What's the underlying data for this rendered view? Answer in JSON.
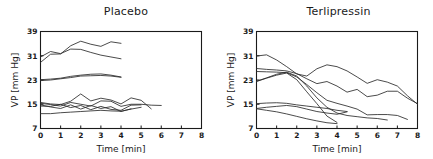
{
  "figure": {
    "background": "#ffffff",
    "line_color": "#2b2b2b",
    "axis_color": "#1a1a1a"
  },
  "panels": [
    {
      "id": "placebo",
      "title": "Placebo"
    },
    {
      "id": "terlipressin",
      "title": "Terlipressin"
    }
  ],
  "axes": {
    "xlabel": "Time [min]",
    "ylabel": "VP [mm Hg]",
    "xticks": [
      "0",
      "1",
      "2",
      "3",
      "4",
      "5",
      "6",
      "7",
      "8"
    ],
    "yticks": [
      "7",
      "15",
      "23",
      "31",
      "39"
    ],
    "xlim": [
      0,
      8
    ],
    "ylim": [
      7,
      39
    ]
  },
  "chart_data": [
    {
      "type": "line",
      "title": "Placebo",
      "xlabel": "Time [min]",
      "ylabel": "VP [mm Hg]",
      "xlim": [
        0,
        8
      ],
      "ylim": [
        7,
        39
      ],
      "grid": false,
      "legend": "none",
      "x_ticks": [
        0,
        1,
        2,
        3,
        4,
        5,
        6,
        7,
        8
      ],
      "y_ticks": [
        7,
        15,
        23,
        31,
        39
      ],
      "series": [
        {
          "name": "subject-p1",
          "x": [
            0,
            0.5,
            1,
            1.5,
            2,
            2.5,
            3,
            3.5,
            4
          ],
          "y": [
            28.8,
            31.5,
            31.6,
            34.3,
            35.8,
            34.8,
            34.1,
            35.6,
            35.1
          ]
        },
        {
          "name": "subject-p2",
          "x": [
            0,
            0.5,
            1,
            1.5,
            2,
            2.5,
            3,
            3.5,
            4
          ],
          "y": [
            30.6,
            32.4,
            31.7,
            33.2,
            33.1,
            32.1,
            31.2,
            30.6,
            30.0
          ]
        },
        {
          "name": "subject-p3",
          "x": [
            0,
            0.5,
            1,
            1.5,
            2,
            2.5,
            3,
            3.5,
            4
          ],
          "y": [
            23.1,
            23.3,
            23.6,
            24.2,
            24.6,
            24.9,
            25.0,
            24.6,
            24.0
          ]
        },
        {
          "name": "subject-p4",
          "x": [
            0,
            0.5,
            1,
            1.5,
            2,
            2.5,
            3,
            3.5,
            4
          ],
          "y": [
            22.8,
            23.0,
            23.4,
            23.8,
            24.3,
            24.4,
            24.5,
            24.3,
            23.9
          ]
        },
        {
          "name": "subject-p5",
          "x": [
            0,
            0.5,
            1,
            1.5,
            2,
            2.5,
            3,
            3.5,
            4,
            4.5,
            5,
            5.5
          ],
          "y": [
            15.6,
            15.1,
            14.9,
            16.0,
            18.4,
            16.1,
            17.0,
            16.4,
            15.1,
            17.1,
            16.3,
            13.5
          ]
        },
        {
          "name": "subject-p6",
          "x": [
            0,
            0.5,
            1,
            1.5,
            2,
            2.5,
            3,
            3.5,
            4,
            4.5,
            5,
            5.5,
            6
          ],
          "y": [
            15.3,
            14.9,
            14.4,
            15.6,
            15.0,
            14.4,
            16.1,
            16.0,
            14.3,
            15.0,
            15.0,
            14.7,
            14.6
          ]
        },
        {
          "name": "subject-p7",
          "x": [
            0,
            0.5,
            1,
            1.5,
            2,
            2.5,
            3,
            3.5,
            4,
            4.5,
            5
          ],
          "y": [
            14.4,
            14.3,
            15.0,
            13.9,
            14.6,
            13.2,
            14.3,
            13.3,
            13.0,
            14.7,
            14.8
          ]
        },
        {
          "name": "subject-p8",
          "x": [
            0,
            0.5,
            1,
            1.5,
            2,
            2.5,
            3,
            3.5,
            4,
            4.5
          ],
          "y": [
            14.8,
            14.1,
            13.6,
            14.8,
            13.4,
            14.6,
            13.6,
            14.2,
            12.6,
            13.5
          ]
        },
        {
          "name": "subject-p9",
          "x": [
            0,
            0.5,
            1,
            1.5,
            2,
            2.5,
            3,
            3.5,
            4,
            4.5,
            5
          ],
          "y": [
            11.9,
            11.9,
            12.2,
            12.4,
            12.6,
            12.8,
            13.0,
            12.8,
            12.7,
            13.4,
            14.0
          ]
        }
      ]
    },
    {
      "type": "line",
      "title": "Terlipressin",
      "xlabel": "Time [min]",
      "ylabel": "VP [mm Hg]",
      "xlim": [
        0,
        8
      ],
      "ylim": [
        7,
        39
      ],
      "grid": false,
      "legend": "none",
      "x_ticks": [
        0,
        1,
        2,
        3,
        4,
        5,
        6,
        7,
        8
      ],
      "y_ticks": [
        7,
        15,
        23,
        31,
        39
      ],
      "series": [
        {
          "name": "subject-t1",
          "x": [
            0,
            0.5,
            1,
            1.5,
            2,
            2.5,
            3,
            3.5,
            4,
            4.5,
            5,
            5.5,
            6,
            6.5,
            7,
            7.5,
            8
          ],
          "y": [
            30.9,
            31.3,
            29.6,
            27.4,
            25.0,
            24.3,
            26.7,
            28.0,
            27.4,
            26.0,
            24.0,
            21.9,
            23.1,
            22.3,
            21.0,
            17.8,
            15.0
          ]
        },
        {
          "name": "subject-t2",
          "x": [
            0,
            0.5,
            1,
            1.5,
            2,
            2.5,
            3,
            3.5,
            4,
            4.5,
            5,
            5.5,
            6,
            6.5,
            7,
            7.5,
            8
          ],
          "y": [
            26.8,
            26.5,
            26.3,
            26.0,
            25.1,
            23.4,
            21.8,
            22.5,
            21.0,
            19.0,
            19.9,
            17.5,
            18.0,
            19.3,
            19.3,
            17.0,
            15.2
          ]
        },
        {
          "name": "subject-t3",
          "x": [
            0,
            0.5,
            1,
            1.5,
            2,
            2.5,
            3,
            3.5,
            4,
            4.5,
            5,
            5.5,
            6,
            6.5,
            7,
            7.5
          ],
          "y": [
            25.8,
            25.7,
            25.6,
            25.4,
            24.0,
            21.5,
            18.8,
            16.3,
            15.3,
            14.4,
            13.4,
            11.5,
            11.6,
            11.6,
            11.3,
            10.0
          ]
        },
        {
          "name": "subject-t4",
          "x": [
            0,
            0.5,
            1,
            1.5,
            2,
            2.5,
            3,
            3.5,
            4,
            4.5,
            5,
            5.5,
            6,
            6.5
          ],
          "y": [
            22.6,
            23.7,
            24.9,
            25.6,
            24.3,
            21.0,
            17.1,
            14.0,
            12.1,
            11.3,
            10.9,
            10.5,
            10.3,
            9.8
          ]
        },
        {
          "name": "subject-t5",
          "x": [
            0,
            0.5,
            1,
            1.5,
            2,
            2.5,
            3,
            3.5,
            4
          ],
          "y": [
            22.5,
            23.6,
            24.6,
            25.3,
            23.1,
            19.1,
            15.2,
            11.1,
            9.0
          ]
        },
        {
          "name": "subject-t6",
          "x": [
            0,
            0.5,
            1,
            1.5,
            2,
            2.5,
            3,
            3.5,
            4,
            4.5
          ],
          "y": [
            15.2,
            15.4,
            15.5,
            15.3,
            14.8,
            14.4,
            14.0,
            13.6,
            13.0,
            12.6
          ]
        },
        {
          "name": "subject-t7",
          "x": [
            0,
            0.5,
            1,
            1.5,
            2,
            2.5,
            3,
            3.5,
            4,
            4.5
          ],
          "y": [
            13.6,
            14.0,
            14.3,
            14.6,
            14.2,
            13.4,
            12.6,
            12.1,
            11.7,
            12.5
          ]
        },
        {
          "name": "subject-t8",
          "x": [
            0,
            0.5,
            1,
            1.5,
            2,
            2.5,
            3,
            3.5,
            4
          ],
          "y": [
            13.5,
            13.0,
            12.5,
            11.8,
            11.0,
            10.2,
            9.5,
            8.9,
            8.6
          ]
        }
      ]
    }
  ]
}
